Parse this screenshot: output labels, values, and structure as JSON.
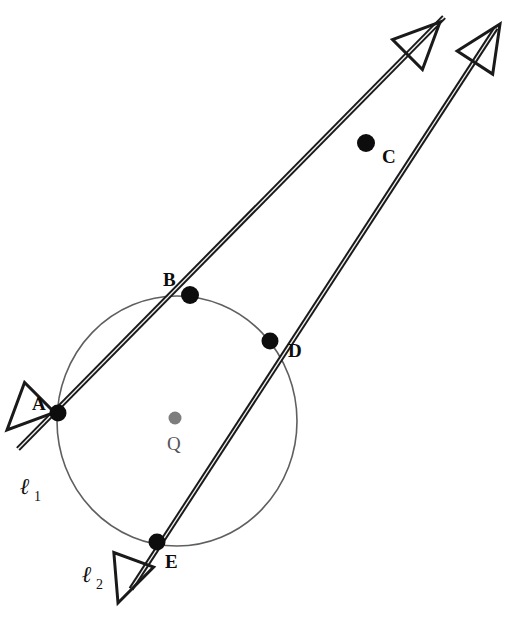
{
  "figure": {
    "background_color": "#ffffff"
  },
  "colors": {
    "stroke": "#1a1a1a",
    "circle_stroke": "#5f5f5f",
    "point_fill": "#0d0d0d",
    "center_fill": "#7d7d7d",
    "label_color": "#0d0d0d",
    "center_label_color": "#555555"
  },
  "circle": {
    "name": "circle-Q",
    "center_label": "Q",
    "cx": 177,
    "cy": 421,
    "rx": 120,
    "ry": 125,
    "stroke_width": 1.6,
    "center_dot": {
      "cx": 175,
      "cy": 418,
      "r": 6.5
    },
    "center_label_pos": {
      "x": 167,
      "y": 450
    }
  },
  "points": [
    {
      "id": "A",
      "label": "A",
      "cx": 58,
      "cy": 413,
      "r": 8.5,
      "label_x": 32,
      "label_y": 410
    },
    {
      "id": "B",
      "label": "B",
      "cx": 190,
      "cy": 295,
      "r": 9.0,
      "label_x": 163,
      "label_y": 286
    },
    {
      "id": "C",
      "label": "C",
      "cx": 366,
      "cy": 143,
      "r": 9.0,
      "label_x": 382,
      "label_y": 163
    },
    {
      "id": "D",
      "label": "D",
      "cx": 270,
      "cy": 341,
      "r": 8.5,
      "label_x": 288,
      "label_y": 357
    },
    {
      "id": "E",
      "label": "E",
      "cx": 157,
      "cy": 542,
      "r": 8.5,
      "label_x": 165,
      "label_y": 568
    }
  ],
  "lines": [
    {
      "id": "l1",
      "label_main": "ℓ",
      "label_sub": "1",
      "label_main_pos": {
        "x": 20,
        "y": 494
      },
      "label_sub_pos": {
        "x": 34,
        "y": 501
      },
      "through_points": [
        "A",
        "B",
        "C"
      ],
      "start": {
        "x": 18,
        "y": 449
      },
      "end": {
        "x": 444,
        "y": 17
      },
      "stroke_width": 3.2,
      "arrow_start": true,
      "arrow_end": true
    },
    {
      "id": "l2",
      "label_main": "ℓ",
      "label_sub": "2",
      "label_main_pos": {
        "x": 82,
        "y": 582
      },
      "label_sub_pos": {
        "x": 96,
        "y": 589
      },
      "through_points": [
        "E",
        "D",
        "C"
      ],
      "start": {
        "x": 131,
        "y": 589
      },
      "end": {
        "x": 496,
        "y": 28
      },
      "stroke_width": 3.2,
      "arrow_start": true,
      "arrow_end": true
    }
  ],
  "arrowheads": [
    {
      "id": "arrow-l1-lower-left",
      "tip_x": 7,
      "tip_y": 430,
      "angle_deg": 225,
      "size": 46
    },
    {
      "id": "arrow-l1-upper-right",
      "tip_x": 440,
      "tip_y": 22,
      "angle_deg": 45,
      "size": 46
    },
    {
      "id": "arrow-l2-lower-left",
      "tip_x": 118,
      "tip_y": 603,
      "angle_deg": 250,
      "size": 46
    },
    {
      "id": "arrow-l2-upper-right",
      "tip_x": 500,
      "tip_y": 24,
      "angle_deg": 57,
      "size": 46
    }
  ]
}
